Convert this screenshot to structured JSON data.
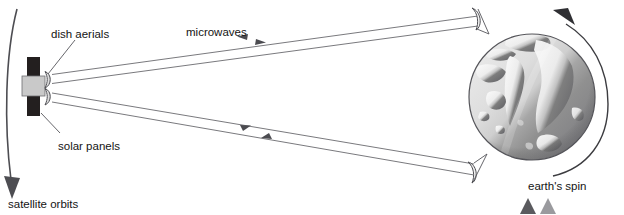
{
  "diagram": {
    "background_color": "#ffffff",
    "line_color": "#58585c",
    "text_color": "#141414",
    "labels": {
      "dish_aerials": "dish aerials",
      "microwaves": "microwaves",
      "solar_panels": "solar panels",
      "satellite_orbits": "satellite orbits",
      "earths_spin": "earth's spin"
    },
    "satellite": {
      "name": "communications-satellite",
      "body_color": "#c9c9c9",
      "panel_color": "#231f1f",
      "dish_count": 2,
      "body": {
        "x": 22,
        "y": 76,
        "width": 23,
        "height": 21
      },
      "panel_top": {
        "x": 27,
        "y": 57,
        "width": 13,
        "height": 21
      },
      "panel_bottom": {
        "x": 27,
        "y": 95,
        "width": 13,
        "height": 21
      },
      "dish_top": {
        "cx": 46,
        "cy": 80
      },
      "dish_bottom": {
        "cx": 46,
        "cy": 96
      }
    },
    "earth": {
      "name": "earth-globe",
      "cx": 532,
      "cy": 97,
      "r": 63,
      "light_side_color": "#dcdcdc",
      "dark_side_color": "#8d8d8d",
      "land_light_color": "#efefef",
      "land_dark_color": "#6f6f6f",
      "outline_color": "#55555a"
    },
    "beams": {
      "name": "microwave-beams",
      "count": 2,
      "uplink_direction": "to-earth",
      "downlink_direction": "to-satellite",
      "arrow_color": "#58585c"
    },
    "ground_stations": {
      "count": 2,
      "upper": {
        "x": 479,
        "y": 14
      },
      "lower": {
        "x": 474,
        "y": 168
      }
    },
    "orbit_arc": {
      "name": "satellite-orbit-arc",
      "direction": "downward",
      "arrow_color": "#4d4d52"
    },
    "spin_arc": {
      "name": "earth-spin-arc",
      "direction": "counter-clockwise",
      "arrow_color": "#3c3c40"
    },
    "corner_marks": {
      "count": 2,
      "colors": [
        "#5a5a5e",
        "#9a9a9e"
      ]
    }
  }
}
